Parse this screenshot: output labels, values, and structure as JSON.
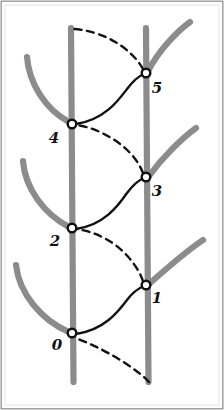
{
  "figure": {
    "background_color": "#ffffff",
    "border_color": "#9a9a9a",
    "vertical_line_color": "#8c8c8c",
    "branch_curve_color": "#8c8c8c",
    "path_color": "#111111",
    "node_fill_color": "#ffffff",
    "node_stroke_color": "#111111",
    "label_color": "#111111"
  },
  "vertical_lines": [
    {
      "name": "left-vertical-line",
      "x": 71,
      "y_top": 28,
      "y_bottom": 382
    },
    {
      "name": "right-vertical-line",
      "x": 146,
      "y_top": 28,
      "y_bottom": 382
    }
  ],
  "nodes": [
    {
      "id": "0",
      "label": "0",
      "x": 72,
      "y": 333,
      "line": "left",
      "label_x": 57,
      "label_y": 350
    },
    {
      "id": "1",
      "label": "1",
      "x": 146,
      "y": 285,
      "line": "right",
      "label_x": 157,
      "label_y": 303
    },
    {
      "id": "2",
      "label": "2",
      "x": 72,
      "y": 228,
      "line": "left",
      "label_x": 55,
      "label_y": 246
    },
    {
      "id": "3",
      "label": "3",
      "x": 146,
      "y": 177,
      "line": "right",
      "label_x": 157,
      "label_y": 196
    },
    {
      "id": "4",
      "label": "4",
      "x": 72,
      "y": 124,
      "line": "left",
      "label_x": 54,
      "label_y": 143
    },
    {
      "id": "5",
      "label": "5",
      "x": 146,
      "y": 73,
      "line": "right",
      "label_x": 157,
      "label_y": 93
    }
  ],
  "segments": [
    {
      "name": "segment-start-to-0",
      "style": "dashed",
      "from": "line-bottom-right",
      "to": "0",
      "path": "M 149 382 C 140 372 112 352 78 339"
    },
    {
      "name": "segment-0-to-1",
      "style": "solid",
      "from": "0",
      "to": "1",
      "path": "M 76 334 C 104 330 118 312 127 300 C 133 292 139 288 144 286"
    },
    {
      "name": "segment-1-to-2",
      "style": "dashed",
      "from": "1",
      "to": "2",
      "path": "M 143 281 C 136 262 120 246 104 238 C 93 232 82 230 77 229"
    },
    {
      "name": "segment-2-to-3",
      "style": "solid",
      "from": "2",
      "to": "3",
      "path": "M 76 229 C 104 225 118 206 127 193 C 133 185 139 180 144 178"
    },
    {
      "name": "segment-3-to-4",
      "style": "dashed",
      "from": "3",
      "to": "4",
      "path": "M 143 173 C 136 155 120 142 104 134 C 93 128 82 126 77 125"
    },
    {
      "name": "segment-4-to-5",
      "style": "solid",
      "from": "4",
      "to": "5",
      "path": "M 76 124 C 104 120 118 101 127 89 C 133 81 139 76 144 74"
    },
    {
      "name": "segment-5-to-end",
      "style": "dashed",
      "from": "5",
      "to": "line-top-left",
      "path": "M 143 69 C 134 53 116 40 98 34 C 86 30 77 29 73 29"
    }
  ],
  "branch_curves": [
    {
      "name": "branch-curve-above-left-node-4",
      "path": "M 27 57 C 29 83 45 109 69 122"
    },
    {
      "name": "branch-curve-above-left-node-2",
      "path": "M 23 161 C 25 188 44 214 69 227"
    },
    {
      "name": "branch-curve-above-left-node-0",
      "path": "M 16 265 C 19 293 41 320 69 332"
    },
    {
      "name": "branch-curve-above-right-node-5",
      "path": "M 190 22 C 175 33 158 52 148 71"
    },
    {
      "name": "branch-curve-above-right-node-3",
      "path": "M 196 128 C 181 139 162 158 149 176"
    },
    {
      "name": "branch-curve-above-right-node-1",
      "path": "M 203 240 C 188 250 167 268 149 284"
    }
  ]
}
